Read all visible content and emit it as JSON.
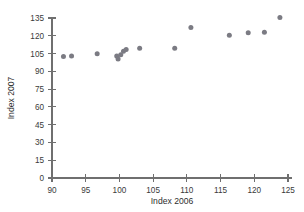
{
  "chart_data": {
    "type": "scatter",
    "title": "",
    "xlabel": "Index 2006",
    "ylabel": "Index 2007",
    "xlim": [
      90,
      125
    ],
    "ylim": [
      0,
      135
    ],
    "xticks": [
      90,
      95,
      100,
      105,
      110,
      115,
      120,
      125
    ],
    "yticks": [
      0,
      15,
      30,
      45,
      60,
      75,
      90,
      105,
      120,
      135
    ],
    "grid": false,
    "legend": null,
    "point_color": "#7b7b83",
    "axis_color": "#6f6f6f",
    "points": [
      {
        "x": 91.7,
        "y": 102.5
      },
      {
        "x": 92.9,
        "y": 103.0
      },
      {
        "x": 96.7,
        "y": 104.8
      },
      {
        "x": 99.6,
        "y": 103.0
      },
      {
        "x": 99.8,
        "y": 100.5
      },
      {
        "x": 100.2,
        "y": 104.0
      },
      {
        "x": 100.6,
        "y": 107.0
      },
      {
        "x": 101.0,
        "y": 108.5
      },
      {
        "x": 103.0,
        "y": 109.5
      },
      {
        "x": 108.2,
        "y": 109.5
      },
      {
        "x": 110.6,
        "y": 127.0
      },
      {
        "x": 116.3,
        "y": 120.5
      },
      {
        "x": 119.1,
        "y": 122.5
      },
      {
        "x": 121.5,
        "y": 123.0
      },
      {
        "x": 123.8,
        "y": 135.5
      }
    ]
  },
  "axes": {
    "x_title": "Index 2006",
    "y_title": "Index 2007",
    "x_tick_labels": [
      "90",
      "95",
      "100",
      "105",
      "110",
      "115",
      "120",
      "125"
    ],
    "y_tick_labels": [
      "0",
      "15",
      "30",
      "45",
      "60",
      "75",
      "90",
      "105",
      "120",
      "135"
    ]
  }
}
